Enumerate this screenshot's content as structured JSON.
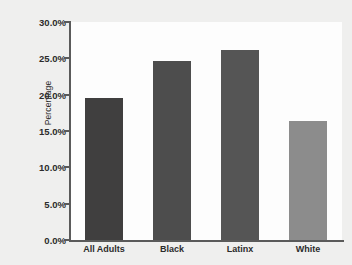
{
  "chart_data": {
    "type": "bar",
    "title": "",
    "xlabel": "",
    "ylabel": "Percentage",
    "categories": [
      "All Adults",
      "Black",
      "Latinx",
      "White"
    ],
    "values": [
      19.6,
      24.7,
      26.1,
      16.4
    ],
    "value_labels": [
      "19.6%",
      "24.7%",
      "26.1%",
      "16.4%"
    ],
    "ylim": [
      0,
      30
    ],
    "ytick_values": [
      0,
      5,
      10,
      15,
      20,
      25,
      30
    ],
    "ytick_labels": [
      "0.0%",
      "5.0%",
      "10.0%",
      "15.0%",
      "20.0%",
      "25.0%",
      "30.0%"
    ],
    "grid": false,
    "legend": null,
    "bar_colors": [
      "#403f3f",
      "#4d4d4d",
      "#555555",
      "#8c8c8c"
    ],
    "colors": {
      "background": "#efefee",
      "plot_background": "#fdfdfd",
      "axis": "#5a5a5a",
      "text": "#2b2b2b"
    }
  }
}
